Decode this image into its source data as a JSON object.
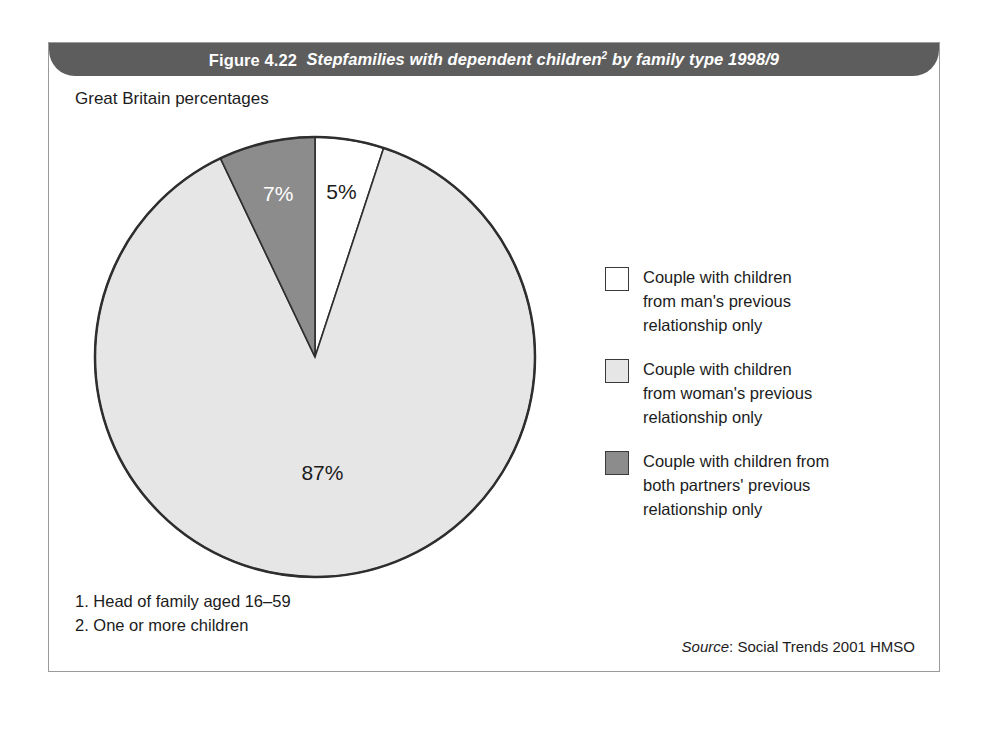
{
  "figure": {
    "number": "Figure 4.22",
    "description": "Stepfamilies with dependent children",
    "description_sup": "2",
    "description_tail": " by family type 1998/9",
    "subtitle": "Great Britain percentages",
    "header_color": "#5d5d5d",
    "frame_border_color": "#9a9a9a"
  },
  "chart_data": {
    "type": "pie",
    "subtitle": "Great Britain percentages",
    "unit": "percentages",
    "region": "Great Britain",
    "period": "1998/9",
    "start_angle_deg": 0,
    "direction": "clockwise",
    "categories": [
      "Couple with children from man's previous relationship only",
      "Couple with children from woman's previous relationship only",
      "Couple with children from both partners' previous relationship only"
    ],
    "values": [
      5,
      87,
      7
    ],
    "labels": [
      "5%",
      "87%",
      "7%"
    ],
    "colors": [
      "#ffffff",
      "#e6e6e6",
      "#8c8c8c"
    ],
    "label_text_colors": [
      "#1c1c1c",
      "#1c1c1c",
      "#ffffff"
    ],
    "legend_position": "right",
    "grid": false
  },
  "legend": {
    "items": [
      {
        "swatch_color": "#ffffff",
        "label": "Couple with children\nfrom man's previous\nrelationship only"
      },
      {
        "swatch_color": "#e6e6e6",
        "label": "Couple with children\nfrom woman's previous\nrelationship only"
      },
      {
        "swatch_color": "#8c8c8c",
        "label": "Couple with children from\nboth partners' previous\nrelationship only"
      }
    ]
  },
  "footnotes": [
    "1. Head of family aged 16–59",
    "2. One or more children"
  ],
  "source": {
    "word": "Source",
    "text": ": Social Trends 2001 HMSO"
  }
}
